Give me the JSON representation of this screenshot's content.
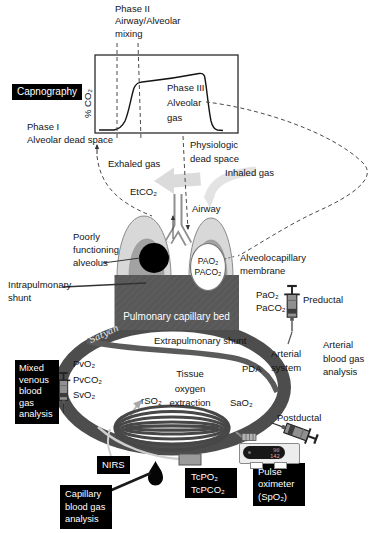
{
  "capnograph": {
    "badge": "Capnography",
    "y_axis": "% CO₂",
    "phase1": "Phase I\nAlveolar dead space",
    "phase2": "Phase II\nAirway/Alveolar\nmixing",
    "phase3": "Phase III\nAlveolar\ngas",
    "physiologic": "Physiologic\ndead space"
  },
  "airway_labels": {
    "exhaled": "Exhaled gas",
    "inhaled": "Inhaled gas",
    "etco2": "EtCO₂",
    "airway": "Airway"
  },
  "lung_labels": {
    "poorly": "Poorly\nfunctioning\nalveolus",
    "alveolar_gas": "PAO₂\nPACO₂",
    "membrane": "Alveolocapillary\nmembrane",
    "intrapulmonary_shunt": "Intrapulmonary\nshunt",
    "capillary_bed": "Pulmonary capillary bed"
  },
  "circulation_labels": {
    "signature": "Satyan",
    "extrapulmonary_shunt": "Extrapulmonary shunt",
    "pda": "PDA",
    "arterial_system": "Arterial\nsystem",
    "venous": "PvO₂\nPvCO₂\nSvO₂",
    "arterial": "PaO₂\nPaCO₂",
    "tissue": "Tissue\noxygen\nextraction",
    "rso2": "rSO₂",
    "sao2": "SaO₂",
    "preductal": "Preductal",
    "postductal": "Postductal"
  },
  "monitors": {
    "arterial_bga": "Arterial\nblood gas\nanalysis",
    "mixed_venous_bga": "Mixed\nvenous\nblood\ngas\nanalysis",
    "capillary_bga": "Capillary\nblood gas\nanalysis",
    "nirs": "NIRS",
    "transcutaneous": "TcPO₂\nTcPCO₂",
    "pulse_ox": "Pulse\noximeter\n(SpO₂)",
    "pulse_ox_spo2": "90",
    "pulse_ox_rate": "142"
  },
  "colors": {
    "badge_bg": "#000000",
    "badge_text": "#ffffff",
    "vessel": "#4d4d4d",
    "capillary_bed": "#585858",
    "lung_outer": "#d8d8d8",
    "lung_inner": "#a2a2a2",
    "flow_arrow": "#d7d7d7",
    "oximeter_digits": "#cf9d9d"
  }
}
